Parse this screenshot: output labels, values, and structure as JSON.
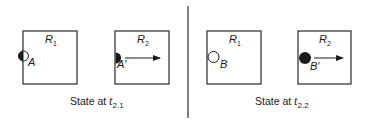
{
  "colors": {
    "ink": "#1a1a1a",
    "line": "#2a2a2a",
    "background": "#ffffff"
  },
  "divider": {
    "x": 188,
    "y1": 6,
    "y2": 118
  },
  "panels": [
    {
      "id": "left",
      "caption": {
        "prefix": "State at ",
        "var": "t",
        "sub": "2.1"
      },
      "boxes": [
        {
          "region": {
            "base": "R",
            "sub": "1"
          },
          "object": {
            "label": "A",
            "state": "half-filled-on-boundary"
          },
          "arrow": false
        },
        {
          "region": {
            "base": "R",
            "sub": "2"
          },
          "object": {
            "label": "A′",
            "state": "half-filled-entering"
          },
          "arrow": true
        }
      ]
    },
    {
      "id": "right",
      "caption": {
        "prefix": "State at ",
        "var": "t",
        "sub": "2.2"
      },
      "boxes": [
        {
          "region": {
            "base": "R",
            "sub": "1"
          },
          "object": {
            "label": "B",
            "state": "empty-circle"
          },
          "arrow": false
        },
        {
          "region": {
            "base": "R",
            "sub": "2"
          },
          "object": {
            "label": "B′",
            "state": "filled-circle"
          },
          "arrow": true
        }
      ]
    }
  ]
}
